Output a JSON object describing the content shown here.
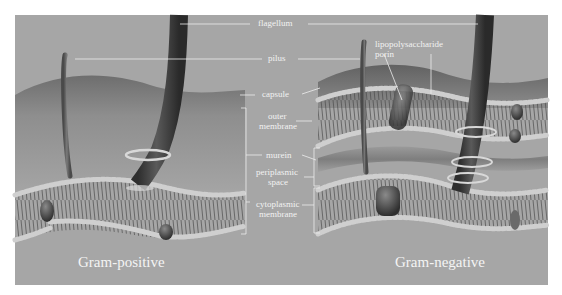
{
  "diagram": {
    "type": "cell-wall-comparison",
    "panels": [
      {
        "id": "left",
        "title": "Gram-positive"
      },
      {
        "id": "right",
        "title": "Gram-negative"
      }
    ],
    "labels": {
      "flagellum": "flagellum",
      "pilus": "pilus",
      "capsule": "capsule",
      "outer_membrane_l1": "outer",
      "outer_membrane_l2": "membrane",
      "murein": "murein",
      "periplasmic_l1": "periplasmic",
      "periplasmic_l2": "space",
      "cytoplasmic_l1": "cytoplasmic",
      "cytoplasmic_l2": "membrane",
      "lps": "lipopolysaccharide",
      "porin": "porin"
    },
    "colors": {
      "background": "#a6a6a6",
      "capsule": "#7a7a7a",
      "flagellum": "#3f3f3f",
      "pilus": "#5e5e5e",
      "lipid_head": "#d6d6d6",
      "protein": "#454545",
      "label": "#f2f2f2",
      "page": "#ffffff"
    }
  }
}
